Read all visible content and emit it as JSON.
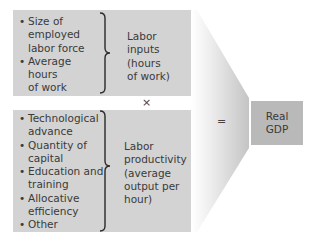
{
  "top_group": {
    "items": [
      "Size of employed labor force",
      "Average hours of work"
    ],
    "items_lines": [
      [
        "Size of",
        "employed",
        "labor force"
      ],
      [
        "Average",
        "hours",
        "of work"
      ]
    ],
    "label": "Labor\ninputs\n(hours\nof work)"
  },
  "operator_multiply": "×",
  "bottom_group": {
    "items_lines": [
      [
        "Technological",
        "advance"
      ],
      [
        "Quantity of",
        "capital"
      ],
      [
        "Education and",
        "training"
      ],
      [
        "Allocative",
        "efficiency"
      ],
      [
        "Other"
      ]
    ],
    "label": "Labor\nproductivity\n(average\noutput per\nhour)"
  },
  "operator_equals": "=",
  "result": {
    "line1": "Real",
    "line2": "GDP"
  },
  "colors": {
    "box_fill": "#d3d3d3",
    "result_fill": "#b9b9b9",
    "text": "#3a3a3a"
  }
}
